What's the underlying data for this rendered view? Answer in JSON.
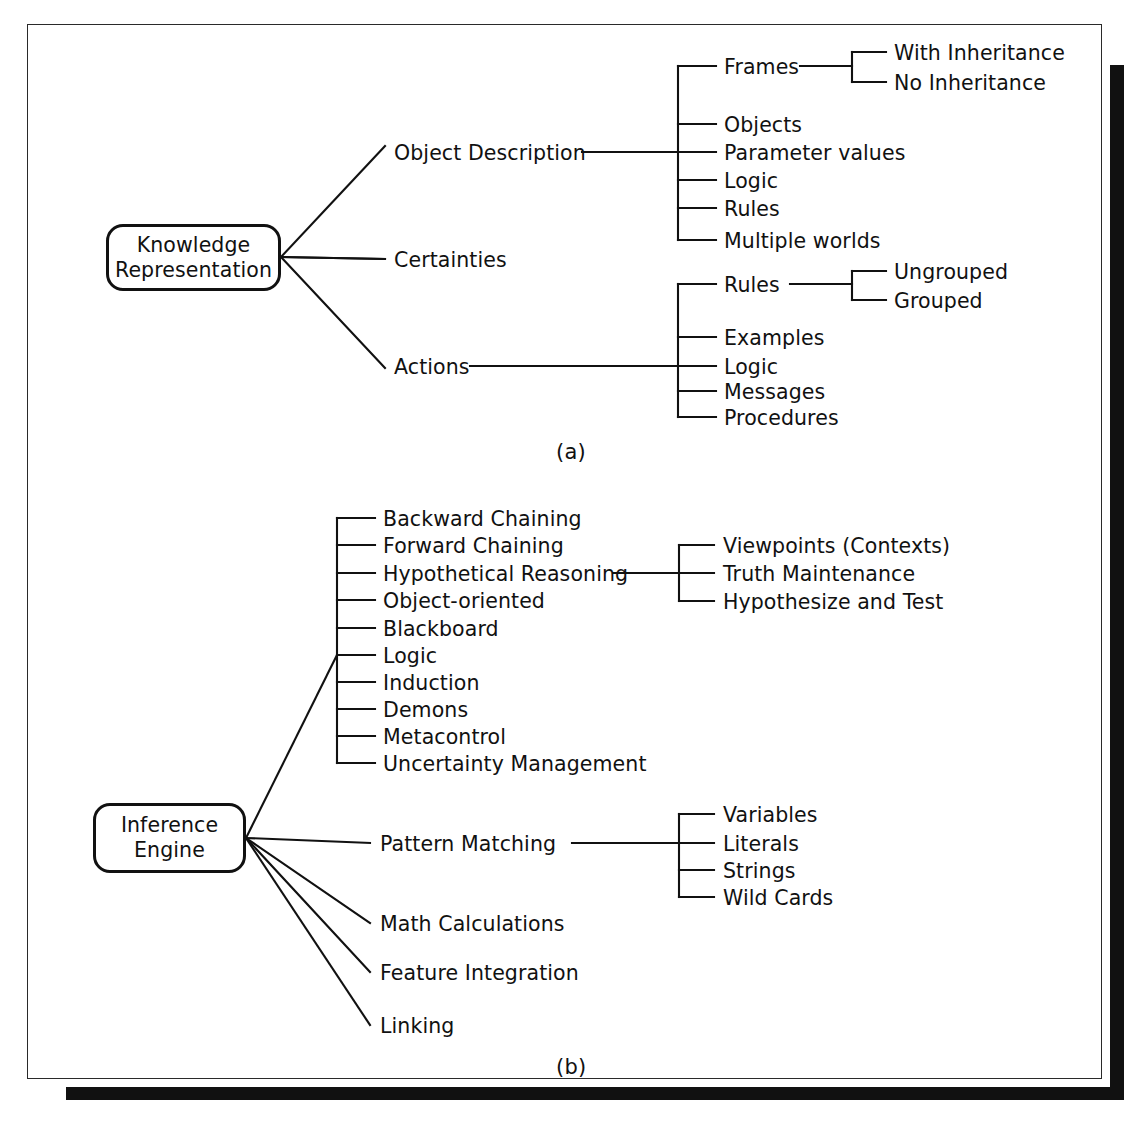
{
  "figure": {
    "caption_a": "(a)",
    "caption_b": "(b)"
  },
  "diagram_a": {
    "root": {
      "line1": "Knowledge",
      "line2": "Representation"
    },
    "branches": [
      {
        "label": "Object Description",
        "children": [
          {
            "label": "Frames",
            "children": [
              {
                "label": "With Inheritance"
              },
              {
                "label": "No Inheritance"
              }
            ]
          },
          {
            "label": "Objects"
          },
          {
            "label": "Parameter values"
          },
          {
            "label": "Logic"
          },
          {
            "label": "Rules"
          },
          {
            "label": "Multiple worlds"
          }
        ]
      },
      {
        "label": "Certainties",
        "children": []
      },
      {
        "label": "Actions",
        "children": [
          {
            "label": "Rules",
            "children": [
              {
                "label": "Ungrouped"
              },
              {
                "label": "Grouped"
              }
            ]
          },
          {
            "label": "Examples"
          },
          {
            "label": "Logic"
          },
          {
            "label": "Messages"
          },
          {
            "label": "Procedures"
          }
        ]
      }
    ]
  },
  "diagram_b": {
    "root": {
      "line1": "Inference",
      "line2": "Engine"
    },
    "methods": [
      {
        "label": "Backward Chaining"
      },
      {
        "label": "Forward Chaining"
      },
      {
        "label": "Hypothetical Reasoning",
        "children": [
          {
            "label": "Viewpoints (Contexts)"
          },
          {
            "label": "Truth Maintenance"
          },
          {
            "label": "Hypothesize and Test"
          }
        ]
      },
      {
        "label": "Object-oriented"
      },
      {
        "label": "Blackboard"
      },
      {
        "label": "Logic"
      },
      {
        "label": "Induction"
      },
      {
        "label": "Demons"
      },
      {
        "label": "Metacontrol"
      },
      {
        "label": "Uncertainty Management"
      }
    ],
    "branches": [
      {
        "label": "Pattern Matching",
        "children": [
          {
            "label": "Variables"
          },
          {
            "label": "Literals"
          },
          {
            "label": "Strings"
          },
          {
            "label": "Wild Cards"
          }
        ]
      },
      {
        "label": "Math Calculations"
      },
      {
        "label": "Feature Integration"
      },
      {
        "label": "Linking"
      }
    ]
  },
  "colors": {
    "ink": "#111111",
    "paper": "#ffffff"
  }
}
